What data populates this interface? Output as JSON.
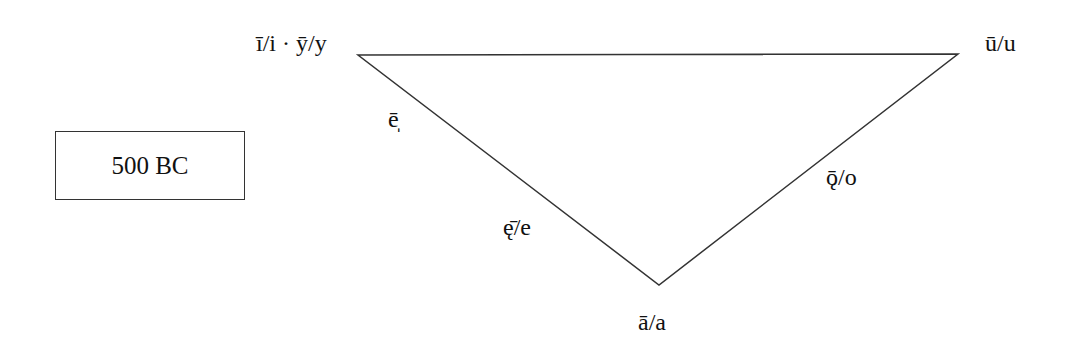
{
  "diagram": {
    "type": "vowel-triangle",
    "period_label": "500 BC",
    "vertices": {
      "top_left": "ī/i · ȳ/y",
      "top_right": "ū/u",
      "bottom": "ā/a"
    },
    "edge_labels": {
      "front_upper": "ē̩",
      "front_lower": "ę̄/e",
      "back": "ǭ/o"
    },
    "line_color": "#333333"
  }
}
